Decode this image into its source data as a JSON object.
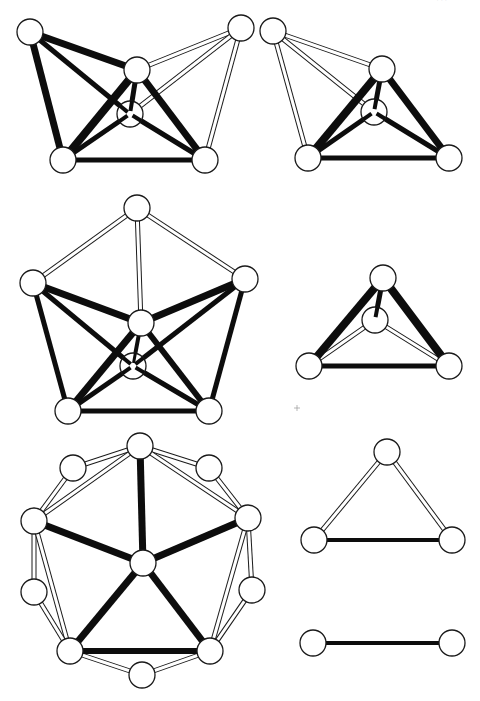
{
  "page": {
    "page_number_fragment": "···"
  },
  "style": {
    "node_radius": 13,
    "black_edge_color": "#0d0d0d",
    "white_edge_outline_color": "#1a1a1a",
    "node_fill": "#ffffff",
    "background": "#ffffff"
  },
  "graphs": [
    {
      "id": "graph-1-five-node-with-inner",
      "nodes": {
        "A": [
          30,
          32
        ],
        "B": [
          137,
          70
        ],
        "C": [
          130,
          114
        ],
        "D": [
          63,
          160
        ],
        "E": [
          205,
          160
        ],
        "F": [
          241,
          28
        ]
      },
      "inner_nodes": [
        "C"
      ],
      "edges": [
        {
          "from": "A",
          "to": "B",
          "type": "black",
          "width": 7
        },
        {
          "from": "A",
          "to": "D",
          "type": "black",
          "width": 7
        },
        {
          "from": "A",
          "to": "C",
          "type": "black",
          "width": 5
        },
        {
          "from": "B",
          "to": "D",
          "type": "black",
          "width": 8
        },
        {
          "from": "B",
          "to": "E",
          "type": "black",
          "width": 7
        },
        {
          "from": "B",
          "to": "C",
          "type": "black",
          "width": 5
        },
        {
          "from": "C",
          "to": "D",
          "type": "black",
          "width": 5
        },
        {
          "from": "C",
          "to": "E",
          "type": "black",
          "width": 5
        },
        {
          "from": "D",
          "to": "E",
          "type": "black",
          "width": 5
        },
        {
          "from": "F",
          "to": "B",
          "type": "white"
        },
        {
          "from": "F",
          "to": "C",
          "type": "white"
        },
        {
          "from": "F",
          "to": "E",
          "type": "white"
        }
      ]
    },
    {
      "id": "graph-2-four-node-with-inner",
      "nodes": {
        "G": [
          273,
          31
        ],
        "H": [
          382,
          69
        ],
        "I": [
          374,
          112
        ],
        "J": [
          308,
          158
        ],
        "K": [
          449,
          158
        ]
      },
      "inner_nodes": [
        "I"
      ],
      "edges": [
        {
          "from": "H",
          "to": "J",
          "type": "black",
          "width": 8
        },
        {
          "from": "H",
          "to": "K",
          "type": "black",
          "width": 7
        },
        {
          "from": "H",
          "to": "I",
          "type": "black",
          "width": 5
        },
        {
          "from": "I",
          "to": "J",
          "type": "black",
          "width": 5
        },
        {
          "from": "I",
          "to": "K",
          "type": "black",
          "width": 5
        },
        {
          "from": "J",
          "to": "K",
          "type": "black",
          "width": 5
        },
        {
          "from": "G",
          "to": "H",
          "type": "white"
        },
        {
          "from": "G",
          "to": "I",
          "type": "white"
        },
        {
          "from": "G",
          "to": "J",
          "type": "white"
        }
      ]
    },
    {
      "id": "graph-3-pentagon-with-center",
      "nodes": {
        "T": [
          137,
          208
        ],
        "L": [
          33,
          283
        ],
        "R": [
          245,
          279
        ],
        "M": [
          141,
          323
        ],
        "N": [
          133,
          366
        ],
        "BL": [
          68,
          411
        ],
        "BR": [
          209,
          411
        ]
      },
      "inner_nodes": [
        "N"
      ],
      "edges": [
        {
          "from": "T",
          "to": "L",
          "type": "white"
        },
        {
          "from": "T",
          "to": "R",
          "type": "white"
        },
        {
          "from": "T",
          "to": "M",
          "type": "white"
        },
        {
          "from": "L",
          "to": "M",
          "type": "black",
          "width": 7
        },
        {
          "from": "R",
          "to": "M",
          "type": "black",
          "width": 7
        },
        {
          "from": "L",
          "to": "BL",
          "type": "black",
          "width": 5
        },
        {
          "from": "R",
          "to": "BR",
          "type": "black",
          "width": 5
        },
        {
          "from": "L",
          "to": "N",
          "type": "black",
          "width": 5
        },
        {
          "from": "R",
          "to": "N",
          "type": "black",
          "width": 5
        },
        {
          "from": "M",
          "to": "BL",
          "type": "black",
          "width": 7
        },
        {
          "from": "M",
          "to": "BR",
          "type": "black",
          "width": 6
        },
        {
          "from": "M",
          "to": "N",
          "type": "black",
          "width": 4
        },
        {
          "from": "N",
          "to": "BL",
          "type": "black",
          "width": 5
        },
        {
          "from": "N",
          "to": "BR",
          "type": "black",
          "width": 5
        },
        {
          "from": "BL",
          "to": "BR",
          "type": "black",
          "width": 5
        }
      ]
    },
    {
      "id": "graph-4-triangle-with-inner",
      "nodes": {
        "P": [
          383,
          278
        ],
        "Q": [
          375,
          320
        ],
        "S": [
          309,
          366
        ],
        "U": [
          449,
          366
        ]
      },
      "inner_nodes": [
        "Q"
      ],
      "edges": [
        {
          "from": "P",
          "to": "S",
          "type": "black",
          "width": 8
        },
        {
          "from": "P",
          "to": "U",
          "type": "black",
          "width": 8
        },
        {
          "from": "P",
          "to": "Q",
          "type": "black",
          "width": 5
        },
        {
          "from": "S",
          "to": "U",
          "type": "black",
          "width": 5
        },
        {
          "from": "Q",
          "to": "S",
          "type": "white"
        },
        {
          "from": "Q",
          "to": "U",
          "type": "white"
        }
      ]
    },
    {
      "id": "graph-5-decagon-star",
      "nodes": {
        "Top": [
          140,
          446
        ],
        "UL": [
          73,
          468
        ],
        "UR": [
          209,
          468
        ],
        "Lb": [
          34,
          521
        ],
        "Rb": [
          248,
          518
        ],
        "C5": [
          143,
          563
        ],
        "ML": [
          34,
          592
        ],
        "MR": [
          252,
          590
        ],
        "BLb": [
          70,
          651
        ],
        "BRb": [
          210,
          651
        ],
        "Bot": [
          142,
          675
        ]
      },
      "inner_nodes": [],
      "edges": [
        {
          "from": "C5",
          "to": "Top",
          "type": "black",
          "width": 7
        },
        {
          "from": "C5",
          "to": "Lb",
          "type": "black",
          "width": 7
        },
        {
          "from": "C5",
          "to": "Rb",
          "type": "black",
          "width": 7
        },
        {
          "from": "C5",
          "to": "BLb",
          "type": "black",
          "width": 7
        },
        {
          "from": "C5",
          "to": "BRb",
          "type": "black",
          "width": 7
        },
        {
          "from": "BLb",
          "to": "BRb",
          "type": "black",
          "width": 6
        },
        {
          "from": "Top",
          "to": "UL",
          "type": "white"
        },
        {
          "from": "Top",
          "to": "UR",
          "type": "white"
        },
        {
          "from": "Top",
          "to": "Lb",
          "type": "white"
        },
        {
          "from": "Top",
          "to": "Rb",
          "type": "white"
        },
        {
          "from": "UL",
          "to": "Lb",
          "type": "white"
        },
        {
          "from": "UR",
          "to": "Rb",
          "type": "white"
        },
        {
          "from": "Lb",
          "to": "ML",
          "type": "white"
        },
        {
          "from": "Lb",
          "to": "BLb",
          "type": "white"
        },
        {
          "from": "Rb",
          "to": "MR",
          "type": "white"
        },
        {
          "from": "Rb",
          "to": "BRb",
          "type": "white"
        },
        {
          "from": "ML",
          "to": "BLb",
          "type": "white"
        },
        {
          "from": "MR",
          "to": "BRb",
          "type": "white"
        },
        {
          "from": "BLb",
          "to": "Bot",
          "type": "white"
        },
        {
          "from": "BRb",
          "to": "Bot",
          "type": "white"
        }
      ]
    },
    {
      "id": "graph-6-triangle",
      "nodes": {
        "X": [
          387,
          452
        ],
        "Y": [
          314,
          540
        ],
        "Z": [
          452,
          540
        ]
      },
      "inner_nodes": [],
      "edges": [
        {
          "from": "Y",
          "to": "Z",
          "type": "black",
          "width": 4
        },
        {
          "from": "X",
          "to": "Y",
          "type": "white"
        },
        {
          "from": "X",
          "to": "Z",
          "type": "white"
        }
      ]
    },
    {
      "id": "graph-7-single-edge",
      "nodes": {
        "V1": [
          313,
          643
        ],
        "V2": [
          452,
          643
        ]
      },
      "inner_nodes": [],
      "edges": [
        {
          "from": "V1",
          "to": "V2",
          "type": "black",
          "width": 4
        }
      ]
    }
  ],
  "artifacts": [
    {
      "type": "cross",
      "x": 297,
      "y": 408,
      "size": 3
    }
  ]
}
